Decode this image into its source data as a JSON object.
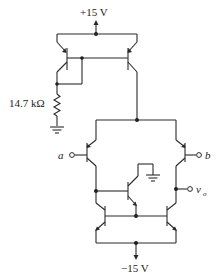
{
  "diagram": {
    "type": "circuit-schematic",
    "supply_top": "+15 V",
    "supply_bottom": "−15 V",
    "resistor_label": "14.7 kΩ",
    "input_a": "a",
    "input_b": "b",
    "output_label": "v",
    "output_sub": "o",
    "components": [
      "pnp current mirror",
      "14.7 kΩ reference resistor",
      "differential pair",
      "npn active load with beta helper",
      "ground"
    ]
  }
}
